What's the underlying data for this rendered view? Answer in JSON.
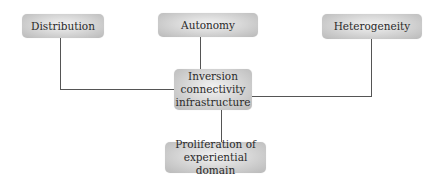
{
  "diagram": {
    "nodes": {
      "distribution": {
        "label": "Distribution"
      },
      "autonomy": {
        "label": "Autonomy"
      },
      "heterogeneity": {
        "label": "Heterogeneity"
      },
      "center": {
        "line1": "Inversion",
        "line2": "connectivity",
        "line3": "infrastructure"
      },
      "proliferation": {
        "line1": "Proliferation of",
        "line2": "experiential domain"
      }
    },
    "edges": [
      {
        "from": "distribution",
        "to": "center"
      },
      {
        "from": "autonomy",
        "to": "center"
      },
      {
        "from": "heterogeneity",
        "to": "center"
      },
      {
        "from": "center",
        "to": "proliferation"
      }
    ],
    "colors": {
      "line": "#555555",
      "box_light": "#f2f2f2",
      "box_dark": "#b9b9b9",
      "text": "#2a2a2a"
    }
  }
}
